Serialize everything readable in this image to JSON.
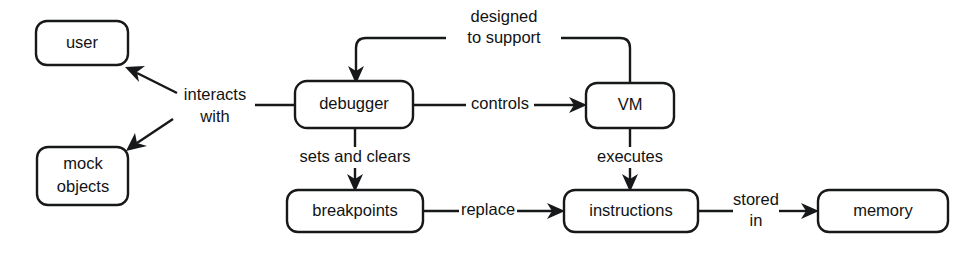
{
  "diagram": {
    "background_color": "#ffffff",
    "stroke_color": "#17181a",
    "text_color": "#121314",
    "nodes": [
      {
        "id": "user",
        "label": "user",
        "x": 36,
        "y": 21,
        "w": 92,
        "h": 44
      },
      {
        "id": "mock_objects",
        "label_line1": "mock",
        "label_line2": "objects",
        "x": 37,
        "y": 147,
        "w": 91,
        "h": 58
      },
      {
        "id": "debugger",
        "label": "debugger",
        "x": 295,
        "y": 81,
        "w": 118,
        "h": 47
      },
      {
        "id": "vm",
        "label": "VM",
        "x": 586,
        "y": 83,
        "w": 88,
        "h": 45
      },
      {
        "id": "breakpoints",
        "label": "breakpoints",
        "x": 287,
        "y": 190,
        "w": 136,
        "h": 42
      },
      {
        "id": "instructions",
        "label": "instructions",
        "x": 564,
        "y": 190,
        "w": 134,
        "h": 42
      },
      {
        "id": "memory",
        "label": "memory",
        "x": 818,
        "y": 190,
        "w": 130,
        "h": 42
      }
    ],
    "edges": [
      {
        "id": "interacts-user",
        "label_line1": "interacts",
        "label_line2": "with",
        "from": "debugger",
        "to": "user",
        "arrow": true
      },
      {
        "id": "interacts-mock",
        "label": "",
        "from": "debugger",
        "to": "mock_objects",
        "arrow": true
      },
      {
        "id": "designed-to-support",
        "label_line1": "designed",
        "label_line2": "to support",
        "from": "vm",
        "to": "debugger",
        "arrow": true
      },
      {
        "id": "controls",
        "label": "controls",
        "from": "debugger",
        "to": "vm",
        "arrow": true
      },
      {
        "id": "sets-and-clears",
        "label": "sets and clears",
        "from": "debugger",
        "to": "breakpoints",
        "arrow": true
      },
      {
        "id": "executes",
        "label": "executes",
        "from": "vm",
        "to": "instructions",
        "arrow": true
      },
      {
        "id": "replace",
        "label": "replace",
        "from": "breakpoints",
        "to": "instructions",
        "arrow": true
      },
      {
        "id": "stored-in",
        "label_line1": "stored",
        "label_line2": "in",
        "from": "instructions",
        "to": "memory",
        "arrow": true
      }
    ]
  }
}
